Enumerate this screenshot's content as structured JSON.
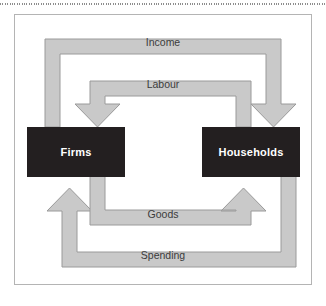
{
  "figure": {
    "type": "circular-flow-diagram",
    "top_rule": "dotted-divider",
    "frame": {
      "border_color": "#b4b4b4",
      "background": "#ffffff"
    },
    "entities": [
      {
        "id": "firms",
        "label": "Firms",
        "fill": "#231f20",
        "text_color": "#ffffff"
      },
      {
        "id": "households",
        "label": "Households",
        "fill": "#231f20",
        "text_color": "#ffffff"
      }
    ],
    "flows": [
      {
        "id": "income",
        "label": "Income",
        "from": "firms",
        "to": "households",
        "direction": "firms-to-households",
        "ring": "outer-top",
        "arrowhead": "down-into-households",
        "fill": "#c9c9c9",
        "stroke": "#9a9a9a"
      },
      {
        "id": "labour",
        "label": "Labour",
        "from": "households",
        "to": "firms",
        "direction": "households-to-firms",
        "ring": "inner-top",
        "arrowhead": "down-into-firms",
        "fill": "#c9c9c9",
        "stroke": "#9a9a9a"
      },
      {
        "id": "goods",
        "label": "Goods",
        "from": "firms",
        "to": "households",
        "direction": "firms-to-households",
        "ring": "inner-bottom",
        "arrowhead": "up-into-households",
        "fill": "#c9c9c9",
        "stroke": "#9a9a9a"
      },
      {
        "id": "spending",
        "label": "Spending",
        "from": "households",
        "to": "firms",
        "direction": "households-to-firms",
        "ring": "outer-bottom",
        "arrowhead": "up-into-firms",
        "fill": "#c9c9c9",
        "stroke": "#9a9a9a"
      }
    ],
    "colors": {
      "flow_fill": "#c9c9c9",
      "flow_stroke": "#9a9a9a",
      "entity_fill": "#231f20",
      "frame_border": "#b4b4b4",
      "label_text": "#3b3b3b",
      "rule": "#8d8d8d"
    }
  }
}
